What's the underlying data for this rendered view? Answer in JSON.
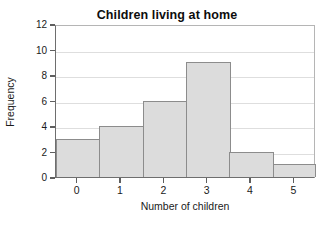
{
  "chart_data": {
    "type": "bar",
    "title": "Children living at home",
    "xlabel": "Number of children",
    "ylabel": "Frequency",
    "categories": [
      "0",
      "1",
      "2",
      "3",
      "4",
      "5"
    ],
    "values": [
      3,
      4,
      6,
      9,
      2,
      1
    ],
    "ylim": [
      0,
      12
    ],
    "yticks": [
      0,
      2,
      4,
      6,
      8,
      10,
      12
    ],
    "ytick_labels": [
      "0",
      "2",
      "4",
      "6",
      "8",
      "10",
      "12"
    ],
    "grid": true,
    "grid_axis": "y",
    "legend": false,
    "legend_position": "none",
    "bar_fill_color": "#dcdcdc",
    "bar_edge_color": "#8c8c8c",
    "grid_color": "#dedede",
    "axis_color": "#6e6e6e",
    "background_color": "#ffffff",
    "bars_contiguous": true,
    "subtitle": "",
    "annotations": []
  }
}
